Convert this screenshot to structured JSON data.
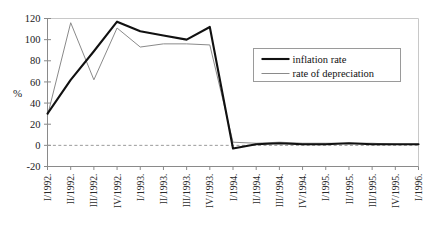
{
  "chart_data": {
    "type": "line",
    "title": "",
    "xlabel": "",
    "ylabel": "%",
    "ylim": [
      -20,
      120
    ],
    "ytick_values": [
      -20,
      0,
      20,
      40,
      60,
      80,
      100,
      120
    ],
    "ytick_labels": [
      "-20",
      "0",
      "20",
      "40",
      "60",
      "80",
      "100",
      "120"
    ],
    "grid": false,
    "zero_line": "dashed",
    "legend_position": "upper-right",
    "categories": [
      "I/1992.",
      "II/1992.",
      "III/1992.",
      "IV/1992.",
      "I/1993.",
      "II/1993.",
      "III/1993.",
      "IV/1993.",
      "I/1994.",
      "II/1994.",
      "III/1994.",
      "IV/1994.",
      "I/1995.",
      "II/1995.",
      "III/1995.",
      "IV/1995.",
      "I/1996."
    ],
    "series": [
      {
        "name": "inflation rate",
        "color": "#111111",
        "width": 2.1,
        "values": [
          30,
          62,
          89,
          117,
          108,
          104,
          100,
          112,
          -3,
          1,
          2,
          1,
          1,
          2,
          1,
          1,
          1
        ]
      },
      {
        "name": "rate of depreciation",
        "color": "#8a8a8a",
        "width": 1.0,
        "values": [
          28,
          116,
          62,
          111,
          93,
          96,
          96,
          95,
          3,
          2,
          3,
          2,
          2,
          2,
          2,
          1,
          1
        ]
      }
    ]
  },
  "legend": {
    "entries": [
      {
        "label": "inflation rate"
      },
      {
        "label": "rate of depreciation"
      }
    ]
  },
  "colors": {
    "inflation": "#111111",
    "depreciation": "#8a8a8a",
    "axis": "#8a8a8a",
    "frame": "#c8c8c8",
    "text": "#1a1a1a"
  }
}
